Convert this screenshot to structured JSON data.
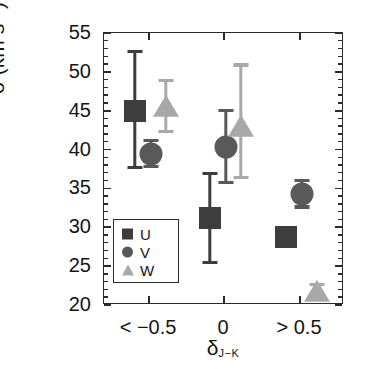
{
  "chart_data": {
    "type": "scatter",
    "title": "",
    "xlabel": "δ J-K",
    "ylabel": "σ (km s⁻¹)",
    "categories": [
      "< −0.5",
      "0",
      "> 0.5"
    ],
    "ylim": [
      20,
      55
    ],
    "ytick_labels": [
      "20",
      "25",
      "30",
      "35",
      "40",
      "45",
      "50",
      "55"
    ],
    "ytick_values": [
      20,
      25,
      30,
      35,
      40,
      45,
      50,
      55
    ],
    "yminor_step": 1,
    "grid": false,
    "legend_position": "lower left",
    "errorbars": true,
    "series": [
      {
        "name": "U",
        "marker": "square",
        "color": "#3d3d3d",
        "values": [
          45.0,
          31.2,
          28.8
        ],
        "err_low": [
          37.7,
          25.5,
          27.8
        ],
        "err_high": [
          52.6,
          36.9,
          29.9
        ]
      },
      {
        "name": "V",
        "marker": "circle",
        "color": "#595959",
        "values": [
          39.4,
          40.3,
          34.3
        ],
        "err_low": [
          37.8,
          35.8,
          32.6
        ],
        "err_high": [
          41.2,
          45.0,
          36.0
        ]
      },
      {
        "name": "W",
        "marker": "triangle",
        "color": "#a8a8a8",
        "values": [
          45.3,
          42.8,
          21.6
        ],
        "err_low": [
          42.3,
          36.4,
          20.8
        ],
        "err_high": [
          48.9,
          50.9,
          22.6
        ]
      }
    ]
  },
  "axes": {
    "x_tick_labels": [
      "< −0.5",
      "0",
      "> 0.5"
    ],
    "y_tick_labels": [
      "55",
      "50",
      "45",
      "40",
      "35",
      "30",
      "25",
      "20"
    ],
    "y_axis_title_main": "σ (km s",
    "y_axis_title_sup": "−1",
    "y_axis_title_tail": ")",
    "x_axis_title_main": "δ",
    "x_axis_title_sub": "J−K"
  },
  "legend": {
    "items": [
      {
        "label": "U",
        "marker": "square",
        "color": "#3d3d3d"
      },
      {
        "label": "V",
        "marker": "circle",
        "color": "#595959"
      },
      {
        "label": "W",
        "marker": "triangle",
        "color": "#a8a8a8"
      }
    ]
  },
  "colors": {
    "axis": "#2b2b2b",
    "text": "#151515",
    "background": "#ffffff",
    "u": "#3d3d3d",
    "v": "#595959",
    "w": "#a8a8a8"
  }
}
